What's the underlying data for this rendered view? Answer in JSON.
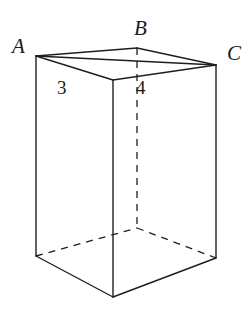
{
  "figure": {
    "type": "rectangular-prism-diagram",
    "stroke_color": "#1e1e1e",
    "background_color": "#ffffff",
    "vertex_labels": [
      {
        "id": "A",
        "text": "A",
        "x": 36,
        "y": 56
      },
      {
        "id": "B",
        "text": "B",
        "x": 137,
        "y": 48
      },
      {
        "id": "C",
        "text": "C",
        "x": 216,
        "y": 65
      }
    ],
    "edge_labels": [
      {
        "id": "AB",
        "text": "3",
        "measures": "edge A to B"
      },
      {
        "id": "BC",
        "text": "4",
        "measures": "edge B to C"
      }
    ],
    "geometry": {
      "top_face": {
        "A": [
          36,
          56
        ],
        "B": [
          137,
          48
        ],
        "C": [
          216,
          65
        ],
        "D_front": [
          113,
          80
        ]
      },
      "bottom_face": {
        "A_bottom": [
          36,
          256
        ],
        "B_bottom_hidden": [
          137,
          228
        ],
        "C_bottom": [
          216,
          258
        ],
        "D_bottom_front": [
          113,
          297
        ]
      },
      "hidden_edges": [
        "B to B_bottom (vertical)",
        "A_bottom to B_bottom",
        "B_bottom to C_bottom"
      ],
      "visible_edges": [
        "A to B",
        "B to C",
        "A to D_front",
        "D_front to C",
        "A to C diagonal",
        "A to A_bottom",
        "C to C_bottom",
        "D_front to D_bottom_front",
        "A_bottom to D_bottom_front",
        "D_bottom_front to C_bottom"
      ]
    }
  }
}
